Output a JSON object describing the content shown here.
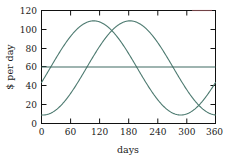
{
  "chart_data": {
    "type": "line",
    "title": "",
    "xlabel": "days",
    "ylabel": "$ per day",
    "xlim": [
      0,
      360
    ],
    "ylim": [
      0,
      120
    ],
    "xticks": [
      0,
      60,
      120,
      180,
      240,
      300,
      360
    ],
    "yticks": [
      0,
      20,
      40,
      60,
      80,
      100,
      120
    ],
    "grid": false,
    "legend": "none",
    "colors": {
      "curve_1": "#4d7a70",
      "curve_2": "#4d7a70",
      "constant_line": "#3f6b63",
      "axis": "#111111",
      "text": "#1a1a1a",
      "background": "#ffffff"
    },
    "series": [
      {
        "name": "curve-1",
        "form": "sinusoid",
        "mean": 59,
        "amplitude": 50,
        "period": 360,
        "peak_x": 108,
        "peak_y": 109,
        "trough_x": 288,
        "trough_y": 9,
        "y_at_x0": 46,
        "y_at_x360": 46,
        "x": [
          0,
          20,
          40,
          60,
          80,
          100,
          108,
          120,
          140,
          160,
          180,
          200,
          220,
          240,
          260,
          280,
          288,
          300,
          320,
          340,
          360
        ],
        "values": [
          46,
          63,
          79,
          92,
          102,
          108,
          109,
          108,
          101,
          90,
          76,
          60,
          43,
          27,
          16,
          10,
          9,
          11,
          20,
          31,
          46
        ]
      },
      {
        "name": "curve-2",
        "form": "sinusoid",
        "mean": 59,
        "amplitude": 50,
        "period": 360,
        "peak_x": 183,
        "peak_y": 109,
        "trough_x": 3,
        "trough_y": 9,
        "y_at_x0": 9,
        "y_at_x360": 46,
        "x": [
          0,
          20,
          40,
          60,
          80,
          100,
          120,
          140,
          160,
          180,
          183,
          200,
          220,
          240,
          260,
          280,
          300,
          320,
          340,
          360
        ],
        "values": [
          9,
          11,
          18,
          29,
          43,
          59,
          75,
          90,
          101,
          108,
          109,
          108,
          102,
          92,
          79,
          63,
          46,
          30,
          17,
          46
        ]
      },
      {
        "name": "constant-line",
        "form": "horizontal",
        "value": 60,
        "x": [
          0,
          360
        ],
        "values": [
          60,
          60
        ]
      }
    ]
  },
  "axes": {
    "x_tick_labels": [
      "0",
      "60",
      "120",
      "180",
      "240",
      "300",
      "360"
    ],
    "y_tick_labels": [
      "0",
      "20",
      "40",
      "60",
      "80",
      "100",
      "120"
    ],
    "x_axis_title": "days",
    "y_axis_title": "$ per day"
  }
}
